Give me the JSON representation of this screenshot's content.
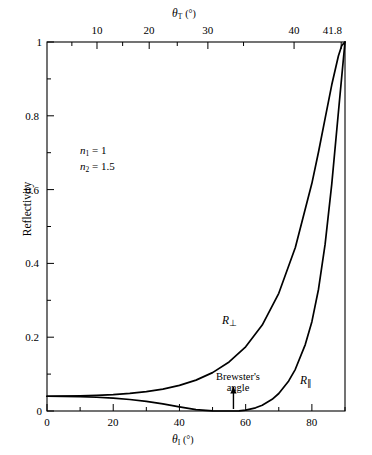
{
  "chart_data": {
    "type": "line",
    "title": "",
    "xlabel": "θ₁ (°)",
    "ylabel": "Reflectivity",
    "top_axis_label": "θₜ (°)",
    "xlim": [
      0,
      90
    ],
    "ylim": [
      0,
      1
    ],
    "grid": false,
    "x_ticks_major": [
      0,
      20,
      40,
      60,
      80
    ],
    "x_tick_labels": [
      "0",
      "20",
      "40",
      "60",
      "80"
    ],
    "x_ticks_minor": [
      10,
      30,
      50,
      70,
      90
    ],
    "y_ticks_major": [
      0,
      0.2,
      0.4,
      0.6,
      0.8,
      1
    ],
    "y_tick_labels": [
      "0",
      "0.2",
      "0.4",
      "0.6",
      "0.8",
      "1"
    ],
    "y_ticks_minor": [
      0.1,
      0.3,
      0.5,
      0.7,
      0.9
    ],
    "top_ticks_major": [
      10,
      20,
      30,
      40,
      41.8
    ],
    "top_tick_labels": [
      "10",
      "20",
      "30",
      "40",
      "41.8"
    ],
    "top_ticks_minor": [
      5,
      15,
      25,
      35
    ],
    "top_axis_max": 41.8,
    "legend_position": "inline-annotations",
    "annotations": [
      {
        "text": "n₁ = 1",
        "x": 8,
        "y": 0.7
      },
      {
        "text": "n₂ = 1.5",
        "x": 8,
        "y": 0.655
      },
      {
        "text": "Brewster's angle",
        "x": 56.3,
        "y": 0.1
      }
    ],
    "series": [
      {
        "name": "R⊥",
        "label": "R⊥",
        "label_x": 60,
        "label_y": 0.235,
        "color": "#000000",
        "x": [
          0,
          5,
          10,
          15,
          20,
          25,
          30,
          35,
          40,
          45,
          50,
          55,
          60,
          65,
          70,
          75,
          80,
          82,
          84,
          86,
          88,
          89,
          90
        ],
        "y": [
          0.04,
          0.0402,
          0.0409,
          0.0422,
          0.0443,
          0.0476,
          0.0524,
          0.0594,
          0.0694,
          0.0837,
          0.104,
          0.133,
          0.174,
          0.233,
          0.319,
          0.443,
          0.617,
          0.702,
          0.793,
          0.884,
          0.962,
          0.99,
          1.0
        ]
      },
      {
        "name": "R∥",
        "label": "R∥",
        "label_x": 78,
        "label_y": 0.105,
        "color": "#000000",
        "x": [
          0,
          5,
          10,
          15,
          20,
          25,
          30,
          35,
          40,
          45,
          50,
          53,
          56.31,
          58,
          60,
          63,
          65,
          68,
          70,
          73,
          75,
          78,
          80,
          82,
          84,
          86,
          88,
          89,
          90
        ],
        "y": [
          0.04,
          0.0397,
          0.0389,
          0.0373,
          0.0348,
          0.0311,
          0.0259,
          0.0192,
          0.0114,
          0.00377,
          0.00023,
          4e-05,
          0.0,
          0.0005,
          0.0025,
          0.0086,
          0.0155,
          0.0317,
          0.0474,
          0.0815,
          0.113,
          0.18,
          0.242,
          0.33,
          0.452,
          0.615,
          0.809,
          0.905,
          1.0
        ]
      }
    ],
    "brewster_angle": 56.31,
    "critical_angle_top": 41.8,
    "normal_incidence_reflectivity": 0.04
  },
  "layout": {
    "plot_left": 47,
    "plot_right": 345,
    "plot_top": 42,
    "plot_bottom": 411
  }
}
